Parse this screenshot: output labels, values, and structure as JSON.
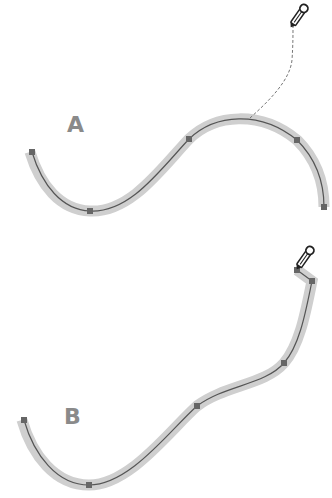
{
  "figure": {
    "panels": [
      {
        "label": "A",
        "description": "Curve with pencil drawing a dashed freehand line extending from the existing path",
        "nodes": [
          [
            32,
            152
          ],
          [
            90,
            211
          ],
          [
            189,
            139
          ],
          [
            297,
            140
          ],
          [
            324,
            207
          ]
        ],
        "pencil_tool": {
          "icon": "pencil-icon",
          "position": [
            293,
            18
          ]
        },
        "dashed_line": true
      },
      {
        "label": "B",
        "description": "Resulting reshaped curve after pencil redraw",
        "nodes": [
          [
            24,
            420
          ],
          [
            89,
            485
          ],
          [
            197,
            406
          ],
          [
            284,
            363
          ],
          [
            312,
            281
          ],
          [
            297,
            270
          ]
        ],
        "pencil_tool": {
          "icon": "pencil-icon",
          "position": [
            308,
            258
          ]
        },
        "dashed_line": false
      }
    ],
    "colors": {
      "stroke_highlight": "#cfcfcf",
      "path_line": "#555555",
      "anchor_node": "#666666",
      "label": "#8a8a8a"
    }
  }
}
